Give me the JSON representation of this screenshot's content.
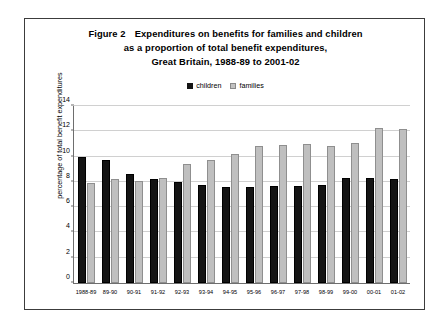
{
  "figure": {
    "title_line1_prefix": "Figure 2",
    "title_line1": "Expenditures on benefits for families and children",
    "title_line2": "as a proportion of total benefit expenditures,",
    "title_line3": "Great Britain, 1988-89 to 2001-02"
  },
  "legend": {
    "position": "top-center",
    "entries": [
      {
        "label": "children",
        "color": "#141414",
        "icon": "square-filled-icon"
      },
      {
        "label": "families",
        "color": "#bfbfbf",
        "icon": "square-light-icon"
      }
    ]
  },
  "chart_data": {
    "type": "bar",
    "xlabel": "",
    "ylabel": "percentage of total benefit expenditures",
    "ylim": [
      0,
      14
    ],
    "yticks": [
      0,
      2,
      4,
      6,
      8,
      10,
      12,
      14
    ],
    "ytick_labels": [
      "0",
      "2",
      "4",
      "6",
      "8",
      "10",
      "12",
      "14"
    ],
    "grid": true,
    "legend_position": "top-center",
    "categories": [
      "1988-89",
      "89-90",
      "90-91",
      "91-92",
      "92-93",
      "93-94",
      "94-95",
      "95-96",
      "96-97",
      "97-98",
      "98-99",
      "99-00",
      "00-01",
      "01-02"
    ],
    "series": [
      {
        "name": "children",
        "color": "#141414",
        "values": [
          10.0,
          9.7,
          8.6,
          8.2,
          8.0,
          7.75,
          7.6,
          7.6,
          7.7,
          7.7,
          7.75,
          8.3,
          8.3,
          8.2
        ]
      },
      {
        "name": "families",
        "color": "#bfbfbf",
        "values": [
          7.9,
          8.2,
          8.1,
          8.3,
          9.4,
          9.7,
          10.2,
          10.8,
          10.9,
          11.0,
          10.8,
          11.1,
          12.3,
          12.2
        ]
      }
    ]
  }
}
